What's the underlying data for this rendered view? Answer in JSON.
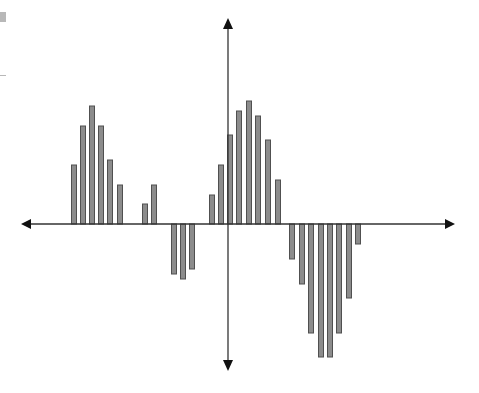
{
  "chart_data": {
    "type": "bar",
    "title": "",
    "xlabel": "",
    "ylabel": "",
    "grid": false,
    "legend": null,
    "axes": {
      "style": "cross-arrows",
      "origin_px": [
        228,
        224
      ],
      "x_arrow_px": [
        21,
        455
      ],
      "y_arrow_px": [
        18,
        371
      ]
    },
    "units_per_px": 0.1,
    "ylim": [
      -15,
      15
    ],
    "bar_width_px": 6,
    "colors": {
      "bar_fill": "#8c8c8c",
      "bar_stroke": "#505050",
      "axis": "#333333"
    },
    "x_px": [
      71,
      80,
      89,
      98,
      107,
      117,
      142,
      151,
      171,
      180,
      189,
      209,
      218,
      227,
      236,
      246,
      255,
      265,
      275,
      289,
      299,
      308,
      318,
      327,
      336,
      346,
      355
    ],
    "values": [
      5.9,
      9.8,
      11.8,
      9.8,
      6.4,
      3.9,
      2.0,
      3.9,
      -5.0,
      -5.5,
      -4.5,
      2.9,
      5.9,
      8.9,
      11.3,
      12.3,
      10.8,
      8.4,
      4.4,
      -3.5,
      -6.0,
      -10.9,
      -13.3,
      -13.3,
      -10.9,
      -7.4,
      -2.0
    ]
  }
}
